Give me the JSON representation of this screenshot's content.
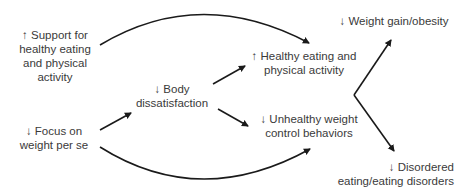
{
  "nodes": {
    "support": {
      "lines": [
        "↑ Support for",
        "healthy eating",
        "and physical",
        "activity"
      ]
    },
    "focus": {
      "lines": [
        "↓ Focus on",
        "weight per se"
      ]
    },
    "body": {
      "lines": [
        "↓ Body",
        "dissatisfaction"
      ]
    },
    "healthy": {
      "lines": [
        "↑ Healthy eating and",
        "physical activity"
      ]
    },
    "unhealthy": {
      "lines": [
        "↓ Unhealthy weight",
        "control behaviors"
      ]
    },
    "weight": {
      "lines": [
        "↓ Weight gain/obesity"
      ]
    },
    "disordered": {
      "lines": [
        "↓ Disordered",
        "eating/eating disorders"
      ]
    }
  },
  "edges": [
    {
      "from": "support",
      "to": "healthy"
    },
    {
      "from": "focus",
      "to": "body"
    },
    {
      "from": "focus",
      "to": "unhealthy"
    },
    {
      "from": "body",
      "to": "healthy"
    },
    {
      "from": "body",
      "to": "unhealthy"
    },
    {
      "from": "healthy+unhealthy",
      "to": "weight"
    },
    {
      "from": "healthy+unhealthy",
      "to": "disordered"
    }
  ],
  "colors": {
    "text": "#3a3a3a",
    "line": "#1a1a1a"
  }
}
